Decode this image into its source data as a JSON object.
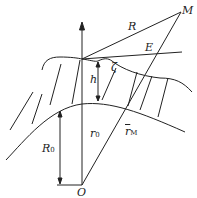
{
  "diagram": {
    "labels": {
      "M": "M",
      "R": "R",
      "E": "E",
      "h": "h",
      "zeta": "ζ",
      "r0": "r",
      "r0_sub": "0",
      "rM": "r",
      "rM_sub": "M",
      "R0": "R",
      "R0_sub": "0",
      "O": "O"
    },
    "colors": {
      "stroke": "#222222"
    }
  }
}
